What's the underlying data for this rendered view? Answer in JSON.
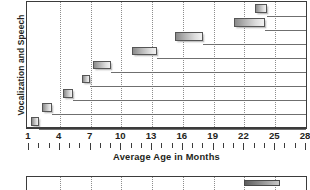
{
  "chart_data": {
    "type": "bar",
    "orientation": "horizontal",
    "subtype": "range-bars",
    "title": "",
    "xlabel": "Average Age in Months",
    "ylabel": "Vocalization and Speech",
    "xlim": [
      1,
      28
    ],
    "xticks": [
      1,
      4,
      7,
      10,
      13,
      16,
      19,
      22,
      25,
      28
    ],
    "xticklabels": [
      "1",
      "4",
      "7",
      "10",
      "13",
      "16",
      "19",
      "22",
      "25",
      "28"
    ],
    "minor_tick_interval": 1,
    "grid": "vertical-dotted",
    "legend": "none",
    "categories": [
      "row-1",
      "row-2",
      "row-3",
      "row-4",
      "row-5",
      "row-6",
      "row-7",
      "row-8",
      "row-9"
    ],
    "bars": [
      {
        "row": 1,
        "start": 1.2,
        "end": 2.0
      },
      {
        "row": 2,
        "start": 2.3,
        "end": 3.2
      },
      {
        "row": 3,
        "start": 4.3,
        "end": 5.3
      },
      {
        "row": 4,
        "start": 6.2,
        "end": 6.9
      },
      {
        "row": 5,
        "start": 7.2,
        "end": 9.0
      },
      {
        "row": 6,
        "start": 11.0,
        "end": 13.5
      },
      {
        "row": 7,
        "start": 15.2,
        "end": 18.0
      },
      {
        "row": 8,
        "start": 21.0,
        "end": 24.0
      },
      {
        "row": 9,
        "start": 23.0,
        "end": 24.2
      }
    ]
  },
  "chart2_data": {
    "type": "bar",
    "orientation": "horizontal",
    "note": "second chart, clipped at bottom edge of screenshot",
    "xlim": [
      1,
      28
    ],
    "gridticks": [
      1,
      4,
      7,
      10,
      13,
      16,
      19,
      22,
      25,
      28
    ],
    "bars": [
      {
        "row": 1,
        "start": 22.0,
        "end": 25.5
      }
    ]
  },
  "axis": {
    "xlabel": "Average Age in Months",
    "ylabel": "Vocalization and Speech"
  },
  "colors": {
    "frame": "#3b3b3b",
    "gridline": "#8d8d8d",
    "rowline": "#6f6f6f",
    "bar_dark": "#8a8a8a",
    "bar_light": "#f2f2f2",
    "bar_border": "#555555",
    "text": "#231f20",
    "background": "#ffffff"
  }
}
